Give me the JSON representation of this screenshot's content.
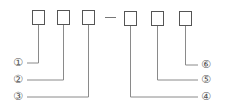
{
  "diagram": {
    "boxes": [
      {
        "id": 1,
        "x": 31,
        "y": 10
      },
      {
        "id": 2,
        "x": 57,
        "y": 10
      },
      {
        "id": 3,
        "x": 82,
        "y": 10
      },
      {
        "id": 4,
        "x": 124,
        "y": 11
      },
      {
        "id": 5,
        "x": 151,
        "y": 11
      },
      {
        "id": 6,
        "x": 179,
        "y": 11
      }
    ],
    "separator": "—",
    "markers": [
      {
        "label": "①",
        "x": 11,
        "y": 57
      },
      {
        "label": "②",
        "x": 11,
        "y": 74
      },
      {
        "label": "③",
        "x": 11,
        "y": 91
      },
      {
        "label": "④",
        "x": 200,
        "y": 91
      },
      {
        "label": "⑤",
        "x": 200,
        "y": 74
      },
      {
        "label": "⑥",
        "x": 200,
        "y": 59
      }
    ],
    "line_color": "#888888",
    "box_color": "#555555"
  }
}
